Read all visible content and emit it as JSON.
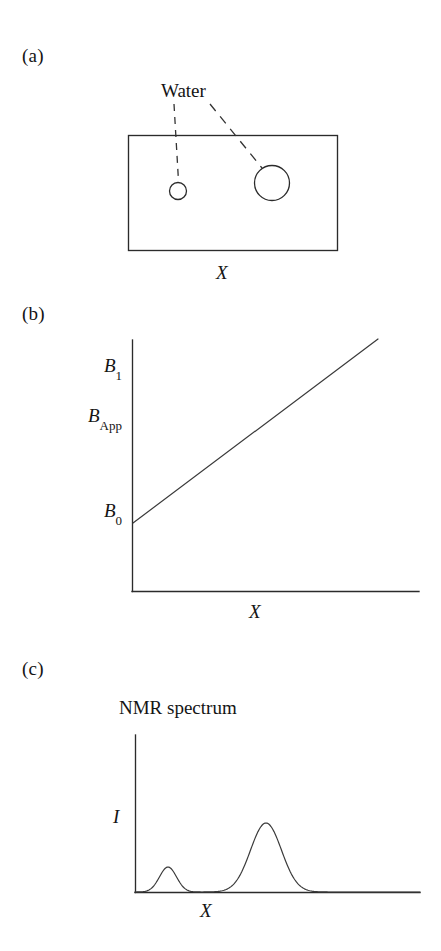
{
  "figure": {
    "background_color": "#ffffff",
    "ink_color": "#2b2b2b"
  },
  "panels": {
    "a": {
      "label": "(a)",
      "annotation_label": "Water",
      "axis_label_x": "X",
      "description_objects": [
        "small water droplet",
        "large water droplet"
      ]
    },
    "b": {
      "label": "(b)",
      "axis_label_x": "X",
      "y_tick_labels": {
        "top": {
          "symbol": "B",
          "subscript": "1"
        },
        "middle": {
          "symbol": "B",
          "subscript": "App"
        },
        "bottom": {
          "symbol": "B",
          "subscript": "0"
        }
      }
    },
    "c": {
      "label": "(c)",
      "title": "NMR spectrum",
      "axis_label_y": "I",
      "axis_label_x": "X"
    }
  },
  "chart_data": [
    {
      "panel": "a",
      "type": "scatter",
      "title": "",
      "xlabel": "X",
      "ylabel": "",
      "annotations": [
        "Water"
      ],
      "sample_rect": {
        "x0": 128,
        "y0": 135,
        "x1": 337,
        "y1": 250
      },
      "objects": [
        {
          "name": "small-droplet",
          "cx": 178,
          "cy": 191,
          "r": 8.5
        },
        {
          "name": "large-droplet",
          "cx": 272,
          "cy": 183,
          "r": 17.5
        }
      ],
      "grid": false,
      "legend": "none"
    },
    {
      "panel": "b",
      "type": "line",
      "title": "",
      "xlabel": "X",
      "ylabel": "B_App",
      "ytick_labels": [
        "B0",
        "B_App",
        "B1"
      ],
      "ytick_values": [
        0,
        0.5,
        1.0
      ],
      "x": [
        0,
        1
      ],
      "values": [
        0.27,
        1.0
      ],
      "description": "Applied field increases linearly with position X from B0 to B1",
      "xlim": [
        0,
        1
      ],
      "ylim": [
        0,
        1
      ],
      "grid": false,
      "legend": "none"
    },
    {
      "panel": "c",
      "type": "line",
      "title": "NMR spectrum",
      "xlabel": "X",
      "ylabel": "I",
      "peaks": [
        {
          "name": "small-peak",
          "center": 168,
          "height": 25,
          "sigma": 8.5
        },
        {
          "name": "large-peak",
          "center": 266,
          "height": 69,
          "sigma": 15.5
        }
      ],
      "baseline_y": 892,
      "axis_x_start": 135,
      "axis_x_end": 420,
      "xlim": [
        135,
        420
      ],
      "ylim": [
        0,
        100
      ],
      "grid": false,
      "legend": "none"
    }
  ]
}
